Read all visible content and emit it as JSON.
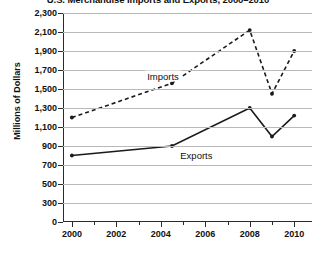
{
  "chart_data": {
    "type": "line",
    "title": "U.S. Merchandise Imports and Exports, 2000–2010",
    "xlabel": "",
    "ylabel": "Millions of Dollars",
    "x": [
      2000,
      2001,
      2002,
      2003,
      2004,
      2005,
      2006,
      2007,
      2008,
      2009,
      2010
    ],
    "xlim": [
      1999.6,
      2010.8
    ],
    "ylim": [
      0,
      2300
    ],
    "grid": true,
    "legend_position": "inline",
    "x_tick_labels": [
      "2000",
      "2002",
      "2004",
      "2006",
      "2008",
      "2010"
    ],
    "x_tick_values": [
      2000,
      2002,
      2004,
      2006,
      2008,
      2010
    ],
    "x_minor_tick_values": [
      2001,
      2003,
      2005,
      2007,
      2009
    ],
    "y_tick_labels": [
      "0",
      "300",
      "500",
      "700",
      "900",
      "1,100",
      "1,300",
      "1,500",
      "1,700",
      "1,900",
      "2,100",
      "2,300"
    ],
    "y_tick_values": [
      0,
      300,
      500,
      700,
      900,
      1100,
      1300,
      1500,
      1700,
      1900,
      2100,
      2300
    ],
    "axis_break_note": "y-axis compressed between 0 and 300",
    "series": [
      {
        "name": "Imports",
        "style": "dashed",
        "color": "#1a1a1a",
        "label_x": 2004.1,
        "label_y": 1640,
        "points": [
          {
            "x": 2000,
            "y": 1200,
            "marker": true
          },
          {
            "x": 2004.5,
            "y": 1560,
            "marker": true
          },
          {
            "x": 2008,
            "y": 2120,
            "marker": true
          },
          {
            "x": 2009,
            "y": 1450,
            "marker": true
          },
          {
            "x": 2010,
            "y": 1900,
            "marker": true
          }
        ]
      },
      {
        "name": "Exports",
        "style": "solid",
        "color": "#1a1a1a",
        "label_x": 2005.6,
        "label_y": 810,
        "points": [
          {
            "x": 2000,
            "y": 800,
            "marker": true
          },
          {
            "x": 2004.5,
            "y": 900,
            "marker": true
          },
          {
            "x": 2008,
            "y": 1300,
            "marker": true
          },
          {
            "x": 2009,
            "y": 1000,
            "marker": true
          },
          {
            "x": 2010,
            "y": 1220,
            "marker": true
          }
        ]
      }
    ]
  }
}
